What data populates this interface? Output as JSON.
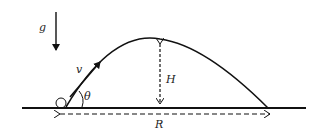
{
  "diagram": {
    "labels": {
      "gravity": "g",
      "velocity": "v",
      "angle": "θ",
      "height": "H",
      "range": "R"
    },
    "colors": {
      "stroke": "#111111",
      "background": "#ffffff"
    },
    "geometry": {
      "ground_y": 108,
      "launch_point": [
        66,
        107
      ],
      "apex": [
        160,
        39
      ],
      "landing_point": [
        268,
        108
      ]
    }
  }
}
